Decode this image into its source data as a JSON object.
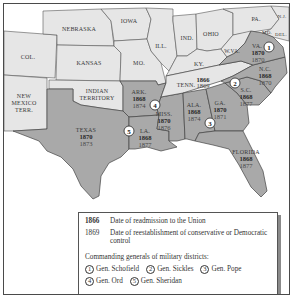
{
  "map": {
    "colors": {
      "union_state": "#e6e6e6",
      "confederate_state": "#a9a9a9",
      "territory": "#e6e6e6",
      "border": "#555555",
      "water": "#ffffff"
    },
    "non_confederate_labels": [
      {
        "id": "col",
        "label": "COL."
      },
      {
        "id": "nebraska",
        "label": "NEBRASKA"
      },
      {
        "id": "kansas",
        "label": "KANSAS"
      },
      {
        "id": "iowa",
        "label": "IOWA"
      },
      {
        "id": "mo",
        "label": "MO."
      },
      {
        "id": "ill",
        "label": "ILL."
      },
      {
        "id": "ind",
        "label": "IND."
      },
      {
        "id": "ohio",
        "label": "OHIO"
      },
      {
        "id": "ky",
        "label": "KY."
      },
      {
        "id": "pa",
        "label": "PA."
      },
      {
        "id": "nj",
        "label": "N.J."
      },
      {
        "id": "md",
        "label": "MD."
      },
      {
        "id": "del",
        "label": "DEL."
      },
      {
        "id": "wva",
        "label": "W.VA."
      },
      {
        "id": "indian_territory_1",
        "label": "INDIAN"
      },
      {
        "id": "indian_territory_2",
        "label": "TERRITORY"
      },
      {
        "id": "nm_1",
        "label": "NEW"
      },
      {
        "id": "nm_2",
        "label": "MEXICO"
      },
      {
        "id": "nm_3",
        "label": "TERR."
      }
    ],
    "confederate_states": [
      {
        "id": "va",
        "label": "VA.",
        "readmitted": "1870",
        "restored": "1870",
        "district": "1"
      },
      {
        "id": "nc",
        "label": "N.C.",
        "readmitted": "1868",
        "restored": "1870",
        "district": "2"
      },
      {
        "id": "sc",
        "label": "S.C.",
        "readmitted": "1868",
        "restored": "1877",
        "district": "2"
      },
      {
        "id": "tenn",
        "label": "TENN.",
        "readmitted": "1866",
        "restored": "1869",
        "district": ""
      },
      {
        "id": "ga",
        "label": "GA.",
        "readmitted": "1870",
        "restored": "1871",
        "district": "3"
      },
      {
        "id": "ala",
        "label": "ALA.",
        "readmitted": "1868",
        "restored": "1874",
        "district": "3"
      },
      {
        "id": "florida",
        "label": "FLORIDA",
        "readmitted": "1868",
        "restored": "1877",
        "district": "3"
      },
      {
        "id": "miss",
        "label": "MISS.",
        "readmitted": "1870",
        "restored": "1876",
        "district": "4"
      },
      {
        "id": "ark",
        "label": "ARK.",
        "readmitted": "1868",
        "restored": "1874",
        "district": "4"
      },
      {
        "id": "la",
        "label": "LA.",
        "readmitted": "1868",
        "restored": "1877",
        "district": "5"
      },
      {
        "id": "texas",
        "label": "TEXAS",
        "readmitted": "1870",
        "restored": "1873",
        "district": "5"
      }
    ],
    "district_markers": [
      "1",
      "2",
      "3",
      "4",
      "5"
    ]
  },
  "legend": {
    "readmission_year": "1866",
    "readmission_text": "Date of readmission to the Union",
    "restoration_year": "1869",
    "restoration_text": "Date of reestablishment of conservative or Democratic control",
    "generals_title": "Commanding generals of military districts:",
    "generals": [
      {
        "num": "1",
        "name": "Gen. Schofield"
      },
      {
        "num": "2",
        "name": "Gen. Sickles"
      },
      {
        "num": "3",
        "name": "Gen. Pope"
      },
      {
        "num": "4",
        "name": "Gen. Ord"
      },
      {
        "num": "5",
        "name": "Gen. Sheridan"
      }
    ]
  }
}
